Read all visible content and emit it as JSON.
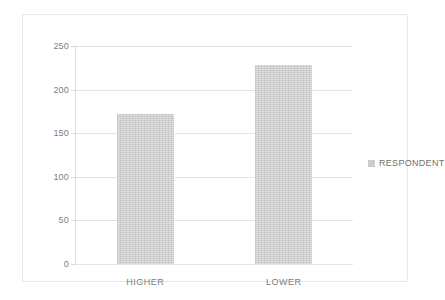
{
  "chart_data": {
    "type": "bar",
    "title": "",
    "subtitle": "",
    "xlabel": "",
    "ylabel": "",
    "categories": [
      "HIGHER",
      "LOWER"
    ],
    "series": [
      {
        "name": "RESPONDENT",
        "values": [
          172,
          228
        ]
      }
    ],
    "ylim": [
      0,
      250
    ],
    "yticks": [
      0,
      50,
      100,
      150,
      200,
      250
    ],
    "ytick_labels": [
      "0",
      "50",
      "100",
      "150",
      "200",
      "250"
    ],
    "grid": "horizontal",
    "legend_position": "right",
    "colors": {
      "bar_fill": "#c9c9c9",
      "gridline": "#e4e4e4",
      "axis_line": "#d6d6d6",
      "tick_text": "#808080",
      "category_text": "#7a7a7a",
      "legend_text": "#6f6f6f",
      "legend_swatch": "#cccccc",
      "frame_border": "#e8e8e8",
      "background": "#ffffff"
    }
  },
  "legend": {
    "entries": [
      {
        "label": "RESPONDENT",
        "swatch_color": "#cccccc"
      }
    ]
  }
}
